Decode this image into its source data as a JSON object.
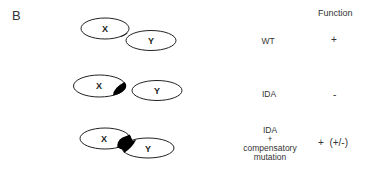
{
  "panel_label": "B",
  "column_header": "Function",
  "rows": [
    {
      "condition_lines": [
        "WT"
      ],
      "function": "+",
      "protein_x": {
        "label": "X",
        "cx": 105,
        "cy": 28.5,
        "rx": 24,
        "ry": 10.5
      },
      "protein_y": {
        "label": "Y",
        "cx": 151,
        "cy": 40.5,
        "rx": 25,
        "ry": 10
      },
      "mutation_patch": "none"
    },
    {
      "condition_lines": [
        "IDA"
      ],
      "function": "-",
      "protein_x": {
        "label": "X",
        "cx": 99.5,
        "cy": 86,
        "rx": 26,
        "ry": 11
      },
      "protein_y": {
        "label": "Y",
        "cx": 157,
        "cy": 90.5,
        "rx": 25,
        "ry": 10
      },
      "mutation_patch": "on X only"
    },
    {
      "condition_lines": [
        "IDA",
        "+",
        "compensatory",
        "mutation"
      ],
      "function": "+  (+/-)",
      "protein_x": {
        "label": "X",
        "cx": 105,
        "cy": 138.5,
        "rx": 25,
        "ry": 10.5
      },
      "protein_y": {
        "label": "Y",
        "cx": 148,
        "cy": 148,
        "rx": 26,
        "ry": 10
      },
      "mutation_patch": "on X and Y at interface"
    }
  ],
  "colors": {
    "outline": "#222222",
    "patch": "#000000",
    "background": "#ffffff"
  }
}
